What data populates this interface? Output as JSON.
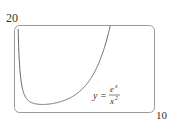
{
  "chart_data": {
    "type": "line",
    "title": "",
    "function": "y = e^x / x^2",
    "xlabel": "",
    "ylabel": "",
    "xlim": [
      0,
      10
    ],
    "ylim": [
      0,
      20
    ],
    "tick_labels": {
      "x_max": "10",
      "y_max": "20",
      "origin": "0"
    },
    "grid": false,
    "legend": null,
    "annotation": {
      "text": "y = e^x / x^2",
      "lhs": "y =",
      "numerator": "e",
      "numerator_sup": "x",
      "denominator": "x",
      "denominator_sup": "2"
    },
    "series": [
      {
        "name": "y = e^x/x^2",
        "x": [
          0.25,
          0.3,
          0.4,
          0.5,
          0.75,
          1.0,
          1.5,
          2.0,
          2.5,
          3.0,
          3.5,
          4.0,
          4.5,
          5.0,
          5.5,
          6.0,
          6.5,
          6.8
        ],
        "y": [
          20.5,
          15.0,
          9.3,
          6.6,
          3.8,
          2.72,
          1.99,
          1.85,
          1.95,
          2.23,
          2.7,
          3.41,
          4.44,
          5.94,
          8.08,
          11.21,
          15.77,
          19.4
        ]
      }
    ]
  },
  "labels": {
    "y_max": "20",
    "x_max": "10"
  }
}
